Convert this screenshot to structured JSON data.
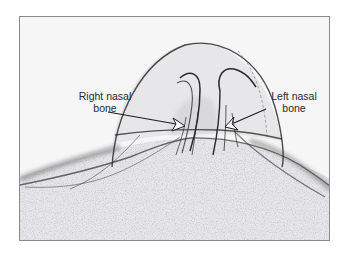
{
  "figure": {
    "type": "ultrasound-image",
    "labels": {
      "right_nasal_bone": {
        "line1": "Right nasal",
        "line2": "bone"
      },
      "left_nasal_bone": {
        "line1": "Left nasal",
        "line2": "bone"
      }
    },
    "colors": {
      "background": "#f6f6f7",
      "frame_border": "#8a8a8a",
      "structure_lines": "#2e2e2e",
      "tissue_fill": "#e2e2e4",
      "label_text": "#2a2a2a"
    }
  }
}
